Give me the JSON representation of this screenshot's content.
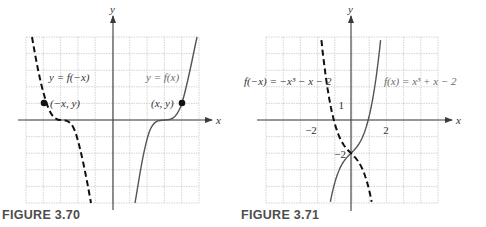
{
  "chart_data": [
    {
      "type": "line",
      "title": "FIGURE 3.70",
      "xlabel": "x",
      "ylabel": "y",
      "grid": true,
      "grid_cells": 10,
      "series": [
        {
          "name": "y = f(x)",
          "style": "solid",
          "color": "#555555"
        },
        {
          "name": "y = f(−x)",
          "style": "dashed",
          "color": "#111111"
        }
      ],
      "annotations": [
        {
          "text": "y = f(−x)",
          "near": "upper-left"
        },
        {
          "text": "y = f(x)",
          "near": "upper-right"
        },
        {
          "text": "(−x, y)",
          "point": "reflected point on dashed curve"
        },
        {
          "text": "(x, y)",
          "point": "point on solid curve"
        }
      ]
    },
    {
      "type": "line",
      "title": "FIGURE 3.71",
      "xlabel": "x",
      "ylabel": "y",
      "grid": true,
      "xlim": [
        -5,
        5
      ],
      "ylim": [
        -5,
        5
      ],
      "x_ticks_labeled": [
        -2,
        2
      ],
      "y_ticks_labeled": [
        1,
        -2
      ],
      "series": [
        {
          "name": "f(x) = x³ + x − 2",
          "style": "solid",
          "color": "#555555",
          "expression": "x^3 + x - 2",
          "x": [
            -1.2,
            -1,
            -0.5,
            0,
            0.5,
            1,
            1.5,
            1.8
          ],
          "y": [
            -4.93,
            -4,
            -2.63,
            -2,
            -1.38,
            0,
            2.88,
            5.63
          ]
        },
        {
          "name": "f(−x) = −x³ − x − 2",
          "style": "dashed",
          "color": "#111111",
          "expression": "-x^3 - x - 2",
          "x": [
            -1.8,
            -1.5,
            -1,
            -0.5,
            0,
            0.5,
            1,
            1.2
          ],
          "y": [
            5.63,
            2.88,
            0,
            -1.38,
            -2,
            -2.63,
            -4,
            -4.93
          ]
        }
      ]
    }
  ],
  "fig1": {
    "caption": "FIGURE 3.70",
    "axis_x": "x",
    "axis_y": "y",
    "label_reflected": "y = f(−x)",
    "label_original": "y = f(x)",
    "point_reflected": "(−x,  y)",
    "point_original": "(x,  y)"
  },
  "fig2": {
    "caption": "FIGURE 3.71",
    "axis_x": "x",
    "axis_y": "y",
    "label_reflected": "f(−x) = −x³ − x − 2",
    "label_original": "f(x) = x³ + x − 2",
    "tick_neg2_x": "−2",
    "tick_2_x": "2",
    "tick_1_y": "1",
    "tick_neg2_y": "−2"
  }
}
